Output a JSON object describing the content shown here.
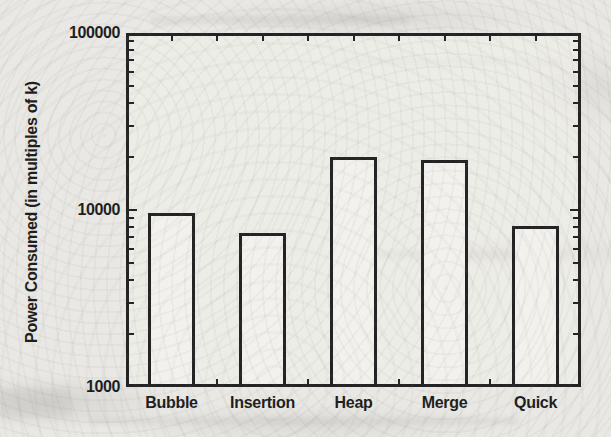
{
  "page": {
    "background": "#e9e8e4",
    "ink": "#232323",
    "text_color": "#1d1d1d"
  },
  "chart_data": {
    "type": "bar",
    "title": "",
    "categories": [
      "Bubble",
      "Insertion",
      "Heap",
      "Merge",
      "Quick"
    ],
    "values": [
      9600,
      7400,
      20000,
      19100,
      8100
    ],
    "xlabel": "",
    "ylabel": "Power Consumed (in multiples of k)",
    "yscale": "log",
    "ylim": [
      1000,
      100000
    ],
    "yticks": [
      1000,
      10000,
      100000
    ],
    "ytick_labels": [
      "1000",
      "10000",
      "100000"
    ],
    "grid": false,
    "legend": "none",
    "bar_fill": "#f2f1ed",
    "bar_border": "#232323"
  }
}
